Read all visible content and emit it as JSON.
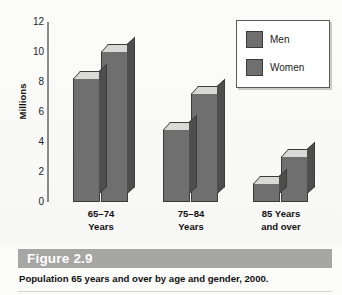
{
  "chart_data": {
    "type": "bar",
    "title": "Population 65 years and over by age and gender, 2000.",
    "figure_number": "Figure 2.9",
    "xlabel": "",
    "ylabel": "Millions",
    "ylim": [
      0,
      12
    ],
    "yticks": [
      0,
      2,
      4,
      6,
      8,
      10,
      12
    ],
    "ytick_labels": [
      "0",
      "2",
      "4",
      "6",
      "8",
      "10",
      "12"
    ],
    "grid": false,
    "legend_position": "top-right",
    "categories": [
      "65-74 Years",
      "75-84 Years",
      "85 Years and over"
    ],
    "category_lines": [
      [
        "65–74",
        "Years"
      ],
      [
        "75–84",
        "Years"
      ],
      [
        "85 Years",
        "and over"
      ]
    ],
    "series": [
      {
        "name": "Men",
        "values": [
          8.3,
          4.9,
          1.3
        ]
      },
      {
        "name": "Women",
        "values": [
          10.1,
          7.3,
          3.1
        ]
      }
    ],
    "colors": {
      "bar_front": "#6f6f6f",
      "bar_top": "#d9d9d7",
      "bar_side": "#4e4e4e",
      "bar_outline": "#3b3b3b",
      "axis": "#8b8b8b",
      "caption_band": "#a6a6a4",
      "figure_number_text": "#ffffff",
      "background": "#fbfbfa"
    }
  },
  "legend": {
    "items": [
      {
        "label": "Men"
      },
      {
        "label": "Women"
      }
    ]
  },
  "caption": {
    "figure_number": "Figure 2.9",
    "text": "Population 65 years and over by age and gender, 2000."
  }
}
